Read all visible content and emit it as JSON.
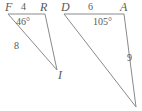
{
  "figure": {
    "background_color": "#ffffff",
    "stroke_color": "#8a8a8a",
    "text_color": "#595959",
    "width": 142,
    "height": 111
  },
  "triangles": [
    {
      "name": "triangle-FRI",
      "vertices": [
        {
          "label": "F",
          "x": 8,
          "y": 14
        },
        {
          "label": "R",
          "x": 45,
          "y": 14
        },
        {
          "label": "I",
          "x": 57,
          "y": 70
        }
      ],
      "side_labels": [
        {
          "label": "4",
          "x": 23,
          "y": 2
        },
        {
          "label": "8",
          "x": 14,
          "y": 42
        }
      ],
      "angle_labels": [
        {
          "label": "46°",
          "x": 17,
          "y": 17
        }
      ]
    },
    {
      "name": "triangle-DAY",
      "vertices": [
        {
          "label": "D",
          "x": 64,
          "y": 14
        },
        {
          "label": "A",
          "x": 124,
          "y": 14
        },
        {
          "label": "",
          "x": 136,
          "y": 107
        }
      ],
      "side_labels": [
        {
          "label": "6",
          "x": 90,
          "y": 2
        },
        {
          "label": "9",
          "x": 126,
          "y": 56
        }
      ],
      "angle_labels": [
        {
          "label": "105°",
          "x": 94,
          "y": 17
        }
      ]
    }
  ],
  "labels": {
    "F": "F",
    "R": "R",
    "I": "I",
    "D": "D",
    "A": "A",
    "four": "4",
    "eight": "8",
    "six": "6",
    "nine": "9",
    "angle_F": "46°",
    "angle_A": "105°"
  }
}
